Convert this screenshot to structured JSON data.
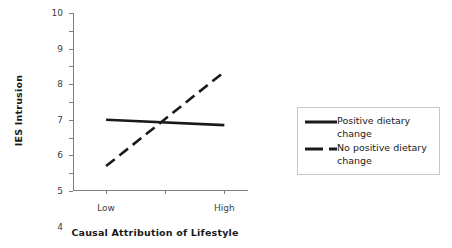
{
  "chart_data": {
    "type": "line",
    "title": "",
    "subtitle": "",
    "xlabel": "Causal Attribution of Lifestyle",
    "ylabel": "IES Intrusion",
    "categories": [
      "Low",
      "High"
    ],
    "x": [
      0,
      1
    ],
    "xlim": [
      -0.28,
      1.2
    ],
    "ylim": [
      0,
      10
    ],
    "yticks": [
      "10",
      "9",
      "8",
      "7",
      "6",
      "5",
      "4",
      "3",
      "2",
      "1",
      "0"
    ],
    "ytick_values": [
      10,
      9,
      8,
      7,
      6,
      5,
      4,
      3,
      2,
      1,
      0
    ],
    "grid": false,
    "legend_position": "right",
    "series": [
      {
        "name": "Positive dietary change",
        "values": [
          4.0,
          3.7
        ],
        "style": "solid",
        "color": "#1a1a1a",
        "swatch": "solid-line-swatch"
      },
      {
        "name": "No positive dietary change",
        "values": [
          1.4,
          6.7
        ],
        "style": "dashed",
        "color": "#1a1a1a",
        "swatch": "dashed-line-swatch"
      }
    ]
  },
  "legend": {
    "items": [
      {
        "label": "Positive dietary change"
      },
      {
        "label": "No positive dietary change"
      }
    ]
  },
  "axes": {
    "y_title": "IES Intrusion",
    "x_title": "Causal Attribution of Lifestyle"
  },
  "colors": {
    "line": "#1a1a1a",
    "axis": "#7f7f7f",
    "tick_text": "#404040",
    "legend_border": "#c8c8c8",
    "background": "#ffffff"
  }
}
